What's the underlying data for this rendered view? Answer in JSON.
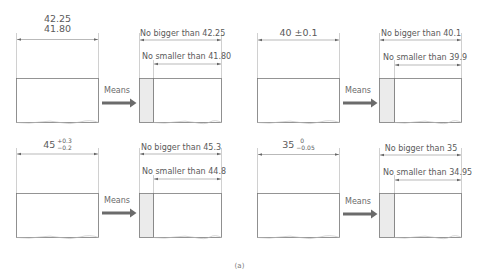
{
  "colors": {
    "line": "#8a8a8a",
    "box_stroke": "#7a7a7a",
    "shade": "#ebebeb",
    "arrow": "#6b6b6b",
    "text": "#5a5a5a"
  },
  "panels": [
    {
      "id": "limits",
      "spec": {
        "type": "limits",
        "upper": "42.25",
        "lower": "41.80"
      },
      "means_label": "Means",
      "max_label": "No bigger than 42.25",
      "min_label": "No smaller than 41.80"
    },
    {
      "id": "plus-minus",
      "spec": {
        "type": "plusminus",
        "text": "40 ±0.1"
      },
      "means_label": "Means",
      "max_label": "No bigger than 40.1",
      "min_label": "No smaller than 39.9"
    },
    {
      "id": "unilateral-asym",
      "spec": {
        "type": "tolerance",
        "nominal": "45",
        "upper": "+0.3",
        "lower": "−0.2"
      },
      "means_label": "Means",
      "max_label": "No bigger than 45.3",
      "min_label": "No smaller than 44.8"
    },
    {
      "id": "unilateral-minus",
      "spec": {
        "type": "tolerance",
        "nominal": "35",
        "upper": "0",
        "lower": "−0.05"
      },
      "means_label": "Means",
      "max_label": "No bigger than 35",
      "min_label": "No smaller than 34.95"
    }
  ],
  "caption": "(a)"
}
